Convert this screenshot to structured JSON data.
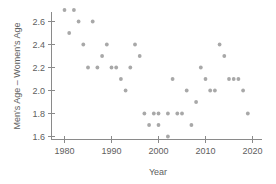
{
  "chart_data": {
    "type": "scatter",
    "title": "",
    "xlabel": "Year",
    "ylabel": "Men's Age – Women's Age",
    "xlim": [
      1978,
      2021
    ],
    "ylim": [
      1.55,
      2.75
    ],
    "grid": false,
    "legend": null,
    "xticks": [
      1980,
      1990,
      2000,
      2010,
      2020
    ],
    "xtick_labels": [
      "1980",
      "1990",
      "2000",
      "2010",
      "2020"
    ],
    "yticks": [
      1.6,
      1.8,
      2.0,
      2.2,
      2.4,
      2.6
    ],
    "ytick_labels": [
      "1.6",
      "1.8",
      "2.0",
      "2.2",
      "2.4",
      "2.6"
    ],
    "marker": "circle",
    "marker_color": "#a8a8a8",
    "points": [
      {
        "x": 1980,
        "y": 2.7
      },
      {
        "x": 1982,
        "y": 2.7
      },
      {
        "x": 1983,
        "y": 2.6
      },
      {
        "x": 1986,
        "y": 2.6
      },
      {
        "x": 1981,
        "y": 2.5
      },
      {
        "x": 1984,
        "y": 2.4
      },
      {
        "x": 1989,
        "y": 2.4
      },
      {
        "x": 1995,
        "y": 2.4
      },
      {
        "x": 1988,
        "y": 2.3
      },
      {
        "x": 1996,
        "y": 2.3
      },
      {
        "x": 1985,
        "y": 2.2
      },
      {
        "x": 1987,
        "y": 2.2
      },
      {
        "x": 1990,
        "y": 2.2
      },
      {
        "x": 1991,
        "y": 2.2
      },
      {
        "x": 1994,
        "y": 2.2
      },
      {
        "x": 1992,
        "y": 2.1
      },
      {
        "x": 1993,
        "y": 2.0
      },
      {
        "x": 1997,
        "y": 1.8
      },
      {
        "x": 1999,
        "y": 1.8
      },
      {
        "x": 2000,
        "y": 1.8
      },
      {
        "x": 2002,
        "y": 1.8
      },
      {
        "x": 2004,
        "y": 1.8
      },
      {
        "x": 2005,
        "y": 1.8
      },
      {
        "x": 1998,
        "y": 1.7
      },
      {
        "x": 2000,
        "y": 1.7
      },
      {
        "x": 2002,
        "y": 1.6
      },
      {
        "x": 2003,
        "y": 2.1
      },
      {
        "x": 2006,
        "y": 2.0
      },
      {
        "x": 2008,
        "y": 1.9
      },
      {
        "x": 2007,
        "y": 1.7
      },
      {
        "x": 2009,
        "y": 2.2
      },
      {
        "x": 2010,
        "y": 2.1
      },
      {
        "x": 2011,
        "y": 2.0
      },
      {
        "x": 2012,
        "y": 2.0
      },
      {
        "x": 2013,
        "y": 2.4
      },
      {
        "x": 2014,
        "y": 2.3
      },
      {
        "x": 2015,
        "y": 2.1
      },
      {
        "x": 2016,
        "y": 2.1
      },
      {
        "x": 2017,
        "y": 2.1
      },
      {
        "x": 2018,
        "y": 2.0
      },
      {
        "x": 2019,
        "y": 1.8
      }
    ]
  },
  "axes": {
    "x_title": "Year",
    "y_title": "Men's Age – Women's Age"
  }
}
